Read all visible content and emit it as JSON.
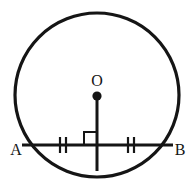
{
  "figure": {
    "kind": "circle-geometry-diagram",
    "background_color": "#ffffff",
    "stroke_color": "#151515",
    "labels": {
      "center": "O",
      "chord_left_endpoint": "A",
      "chord_right_endpoint": "B"
    },
    "circle": {
      "center_x": 97,
      "center_y": 95,
      "radius": 82,
      "stroke_width": 3.2
    },
    "center_dot": {
      "cx": 97,
      "cy": 96,
      "r": 4.6
    },
    "chord": {
      "x1": 22,
      "y1": 145,
      "x2": 173,
      "y2": 145,
      "stroke_width": 3.0
    },
    "perpendicular": {
      "x1": 97,
      "y1": 96,
      "x2": 97,
      "y2": 171,
      "stroke_width": 3.0
    },
    "right_angle_marker": {
      "size": 13,
      "corner_x": 97,
      "corner_y": 145,
      "side": "upper-left",
      "stroke_width": 2.0
    },
    "tick_marks": {
      "count_per_side": 2,
      "left_center_x": 63,
      "right_center_x": 131,
      "spacing": 6,
      "half_height": 8,
      "stroke_width": 2.2
    },
    "label_positions": {
      "O": {
        "x": 97,
        "y": 86
      },
      "A": {
        "x": 16,
        "y": 155
      },
      "B": {
        "x": 180,
        "y": 155
      }
    }
  }
}
